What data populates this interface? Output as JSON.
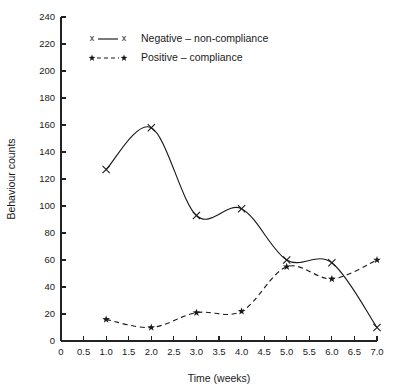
{
  "chart_data": {
    "type": "line",
    "title": "",
    "xlabel": "Time (weeks)",
    "ylabel": "Behaviour counts",
    "xlim": [
      0,
      7.0
    ],
    "ylim": [
      0,
      240
    ],
    "grid": false,
    "legend_position": "inside top-left",
    "x": [
      1.0,
      2.0,
      3.0,
      4.0,
      5.0,
      6.0,
      7.0
    ],
    "xticks": [
      "0",
      "0.5",
      "1.0",
      "1.5",
      "2.0",
      "2.5",
      "3.0",
      "3.5",
      "4.0",
      "4.5",
      "5.0",
      "5.5",
      "6.0",
      "6.5",
      "7.0"
    ],
    "xtick_values": [
      0,
      0.5,
      1.0,
      1.5,
      2.0,
      2.5,
      3.0,
      3.5,
      4.0,
      4.5,
      5.0,
      5.5,
      6.0,
      6.5,
      7.0
    ],
    "yticks": [
      "0",
      "20",
      "40",
      "60",
      "80",
      "100",
      "120",
      "140",
      "160",
      "180",
      "200",
      "220",
      "240"
    ],
    "ytick_values": [
      0,
      20,
      40,
      60,
      80,
      100,
      120,
      140,
      160,
      180,
      200,
      220,
      240
    ],
    "series": [
      {
        "name": "Negative – non-compliance",
        "marker": "x",
        "linestyle": "solid",
        "color": "#1a1a1a",
        "values": [
          127,
          158,
          93,
          98,
          60,
          58,
          10
        ]
      },
      {
        "name": "Positive – compliance",
        "marker": "star",
        "linestyle": "dashed",
        "color": "#1a1a1a",
        "values": [
          16,
          10,
          21,
          22,
          55,
          46,
          60
        ]
      }
    ]
  },
  "legend": {
    "entries": [
      {
        "label": "Negative – non-compliance",
        "marker": "x",
        "linestyle": "solid"
      },
      {
        "label": "Positive – compliance",
        "marker": "star",
        "linestyle": "dashed"
      }
    ]
  },
  "colors": {
    "ink": "#1a1a1a",
    "axis": "#222222",
    "background": "#ffffff"
  }
}
